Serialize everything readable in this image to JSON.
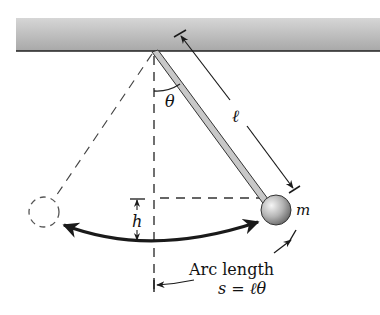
{
  "diagram": {
    "labels": {
      "theta": "θ",
      "length": "ℓ",
      "mass": "m",
      "height": "h",
      "arc_title": "Arc length",
      "arc_formula": "s = ℓθ"
    },
    "colors": {
      "ceiling_top": "#d2d2d2",
      "ceiling_bottom": "#a9a9a9",
      "ceiling_edge": "#222222",
      "rod_fill": "#c8c8c8",
      "ink": "#1a1a1a",
      "dash": "#333333",
      "ball_light": "#f2f2f2",
      "ball_dark": "#6e6e6e"
    }
  }
}
